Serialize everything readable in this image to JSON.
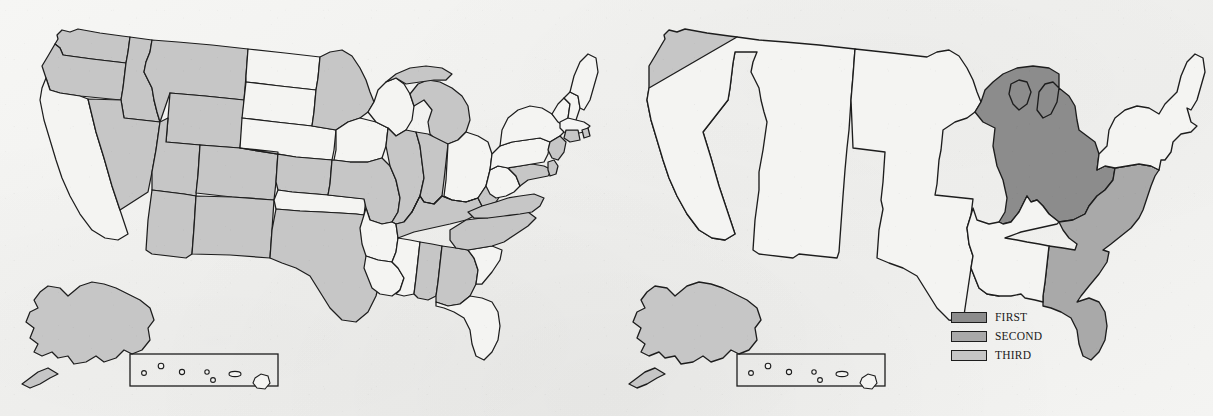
{
  "figure": {
    "type": "choropleth-map-pair",
    "background_color": "#f3f3f1",
    "outline_color": "#1d1d1d"
  },
  "palette": {
    "first": "#8c8c8c",
    "second": "#a9a9a9",
    "third": "#c6c6c6",
    "none": "#f4f4f2"
  },
  "legend": {
    "position": "right-map-lower-center",
    "items": [
      {
        "label": "FIRST",
        "color": "#8c8c8c",
        "rank": 1
      },
      {
        "label": "SECOND",
        "color": "#a9a9a9",
        "rank": 2
      },
      {
        "label": "THIRD",
        "color": "#c6c6c6",
        "rank": 3
      }
    ]
  },
  "maps": [
    {
      "id": "left-map",
      "name": "state-level-shaded-map",
      "insets": [
        "alaska",
        "hawaii"
      ],
      "shaded_states": [
        "Washington",
        "Oregon",
        "Idaho",
        "Montana",
        "Wyoming",
        "Nevada",
        "Utah",
        "Colorado",
        "Arizona",
        "New Mexico",
        "Texas",
        "Kansas",
        "Missouri",
        "Minnesota",
        "Michigan",
        "Illinois",
        "Indiana",
        "Kentucky",
        "Tennessee",
        "Alabama",
        "Georgia",
        "North Carolina",
        "Virginia",
        "Maryland",
        "Delaware",
        "New Jersey",
        "Connecticut",
        "Rhode Island",
        "Alaska"
      ],
      "unshaded_states": [
        "California",
        "North Dakota",
        "South Dakota",
        "Nebraska",
        "Iowa",
        "Wisconsin",
        "Ohio",
        "Oklahoma",
        "Arkansas",
        "Louisiana",
        "Mississippi",
        "Florida",
        "South Carolina",
        "West Virginia",
        "Pennsylvania",
        "New York",
        "Vermont",
        "New Hampshire",
        "Maine",
        "Massachusetts",
        "Hawaii"
      ]
    },
    {
      "id": "right-map",
      "name": "regional-ranked-map",
      "insets": [
        "alaska",
        "hawaii"
      ],
      "regions": [
        {
          "name": "Great Lakes",
          "rank_label": "FIRST",
          "color": "#8c8c8c",
          "states": [
            "Wisconsin",
            "Michigan",
            "Illinois",
            "Indiana",
            "Ohio"
          ]
        },
        {
          "name": "Southeast",
          "rank_label": "SECOND",
          "color": "#a9a9a9",
          "states": [
            "Virginia",
            "North Carolina",
            "South Carolina",
            "Georgia",
            "Florida"
          ]
        },
        {
          "name": "Pacific Coast",
          "rank_label": "THIRD",
          "color": "#c6c6c6",
          "states": [
            "Washington",
            "Oregon",
            "California"
          ]
        },
        {
          "name": "Alaska",
          "rank_label": "THIRD",
          "color": "#c6c6c6",
          "states": [
            "Alaska"
          ]
        }
      ],
      "unranked_regions": [
        "Mountain",
        "Plains",
        "South Central",
        "Northeast",
        "Hawaii"
      ]
    }
  ]
}
